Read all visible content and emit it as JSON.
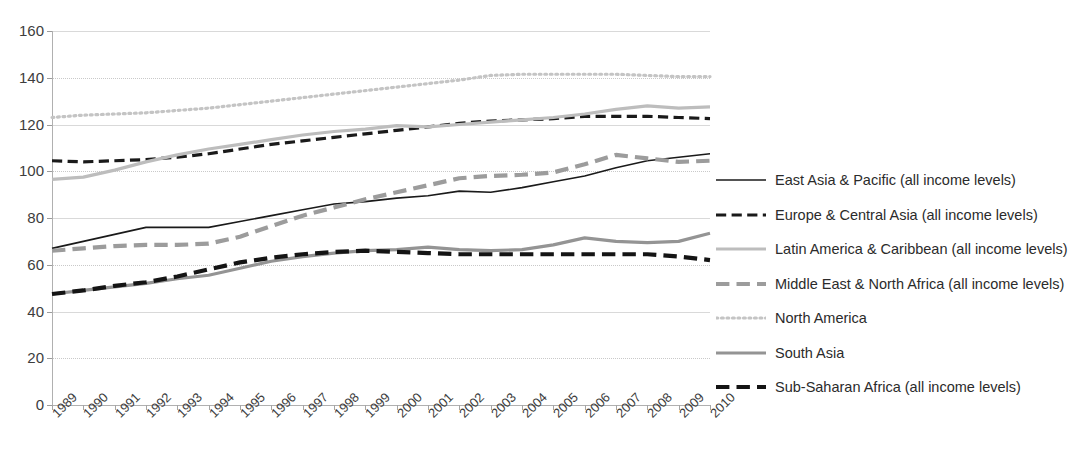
{
  "chart_data": {
    "type": "line",
    "title": "",
    "xlabel": "",
    "ylabel": "",
    "grid": true,
    "legend_position": "right",
    "ylim": [
      0,
      160
    ],
    "yticks": [
      0,
      20,
      40,
      60,
      80,
      100,
      120,
      140,
      160
    ],
    "categories": [
      "1989",
      "1990",
      "1991",
      "1992",
      "1993",
      "1994",
      "1995",
      "1996",
      "1997",
      "1998",
      "1999",
      "2000",
      "2001",
      "2002",
      "2003",
      "2004",
      "2005",
      "2006",
      "2007",
      "2008",
      "2009",
      "2010"
    ],
    "series": [
      {
        "name": "East Asia & Pacific (all income levels)",
        "style": "solid",
        "color": "#1a1a1a",
        "width": 1.6,
        "values": [
          67,
          70,
          73,
          76,
          76,
          76,
          78.5,
          81,
          83.5,
          86,
          87,
          88.5,
          89.5,
          91.5,
          91,
          93,
          95.5,
          98,
          101.5,
          104.5,
          106,
          107.5
        ]
      },
      {
        "name": "Europe & Central Asia (all income levels)",
        "style": "dashed",
        "color": "#1a1a1a",
        "width": 3.2,
        "values": [
          104.5,
          104,
          104.5,
          105,
          106,
          107.5,
          109.5,
          111.5,
          113,
          114.5,
          116,
          117.5,
          119,
          120.5,
          121.5,
          122,
          122.5,
          123.5,
          123.5,
          123.5,
          123,
          122.5
        ]
      },
      {
        "name": "Latin America & Caribbean (all income levels)",
        "style": "solid",
        "color": "#bdbdbd",
        "width": 3.2,
        "values": [
          96.5,
          97.5,
          100.5,
          104,
          107,
          109.5,
          111.5,
          113.5,
          115.5,
          117,
          118,
          119.5,
          119,
          120,
          121,
          122,
          123,
          124.5,
          126.5,
          128,
          127,
          127.5
        ]
      },
      {
        "name": "Middle East & North Africa (all income levels)",
        "style": "dashed",
        "color": "#9c9c9c",
        "width": 4.2,
        "values": [
          66,
          67,
          68,
          68.5,
          68.5,
          69,
          72,
          76.5,
          81,
          84.5,
          88,
          91,
          94,
          97,
          98,
          98.5,
          99.5,
          103,
          107,
          105.5,
          104,
          104.5
        ]
      },
      {
        "name": "North America",
        "style": "dotted",
        "color": "#c4c4c4",
        "width": 3.2,
        "values": [
          123,
          124,
          124.5,
          125,
          126,
          127,
          128.5,
          130,
          131.5,
          133,
          134.5,
          136,
          137.5,
          139,
          141,
          141.5,
          141.5,
          141.5,
          141.5,
          141,
          140.5,
          140.5
        ]
      },
      {
        "name": "South Asia",
        "style": "solid",
        "color": "#949494",
        "width": 3.2,
        "values": [
          47.5,
          49,
          50.5,
          52,
          54,
          55.5,
          58.5,
          61.5,
          63.5,
          65,
          66,
          66.5,
          67.5,
          66.5,
          66,
          66.5,
          68.5,
          71.5,
          70,
          69.5,
          70,
          73.5
        ]
      },
      {
        "name": "Sub-Saharan Africa (all income levels)",
        "style": "dashed",
        "color": "#141414",
        "width": 4.2,
        "values": [
          47.5,
          49,
          51,
          52.5,
          55,
          58,
          61,
          63,
          64.5,
          65.5,
          66,
          65.5,
          65,
          64.5,
          64.5,
          64.5,
          64.5,
          64.5,
          64.5,
          64.5,
          63.5,
          62
        ]
      }
    ]
  },
  "legend": {
    "items": [
      {
        "label": "East Asia & Pacific (all income levels)",
        "key": "solid-thin-black"
      },
      {
        "label": "Europe & Central Asia (all income levels)",
        "key": "dashed-black"
      },
      {
        "label": "Latin America & Caribbean (all income levels)",
        "key": "solid-lightgray"
      },
      {
        "label": "Middle East & North Africa (all income levels)",
        "key": "dashed-gray-thick"
      },
      {
        "label": "North America",
        "key": "dotted-lightgray"
      },
      {
        "label": "South Asia",
        "key": "solid-gray-thick"
      },
      {
        "label": "Sub-Saharan Africa (all income levels)",
        "key": "dashed-black-thick"
      }
    ]
  }
}
